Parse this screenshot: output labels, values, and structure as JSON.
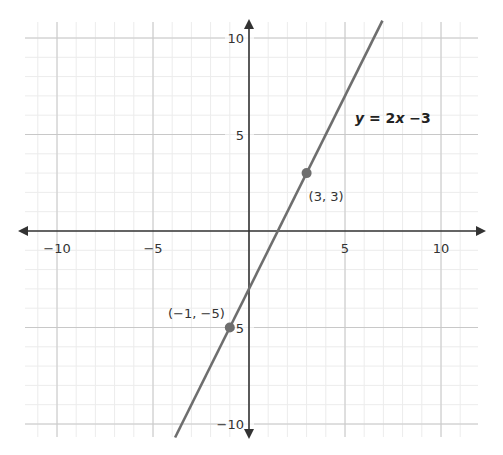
{
  "chart_data": {
    "type": "line",
    "title": "",
    "xlabel": "",
    "ylabel": "",
    "xlim": [
      -12,
      12
    ],
    "ylim": [
      -10.7,
      10.9
    ],
    "grid": true,
    "grid_minor_step": 1,
    "grid_major_step": 5,
    "x_ticks": [
      -10,
      -5,
      5,
      10
    ],
    "y_ticks": [
      10,
      5,
      -5,
      -10
    ],
    "x_tick_labels": [
      "−10",
      "−5",
      "5",
      "10"
    ],
    "y_tick_labels": [
      "10",
      "5",
      "−5",
      "−10"
    ],
    "series": [
      {
        "name": "y = 2x −3",
        "equation": {
          "slope": 2,
          "intercept": -3
        },
        "x": [
          -3.85,
          6.95
        ],
        "values": [
          -10.7,
          10.9
        ]
      }
    ],
    "points": [
      {
        "x": 3,
        "y": 3,
        "label": "(3, 3)"
      },
      {
        "x": -1,
        "y": -5,
        "label": "(−1, −5)"
      }
    ],
    "annotations": [
      {
        "text_parts": [
          "y",
          " = 2",
          "x",
          " −3"
        ],
        "italic_parts": [
          0,
          2
        ],
        "near": "upper-right of line"
      }
    ],
    "colors": {
      "axis": "#333333",
      "line": "#6e6e6e",
      "point": "#6e6e6e",
      "grid_major": "#c8c8c8",
      "grid_minor": "#ececec"
    }
  }
}
